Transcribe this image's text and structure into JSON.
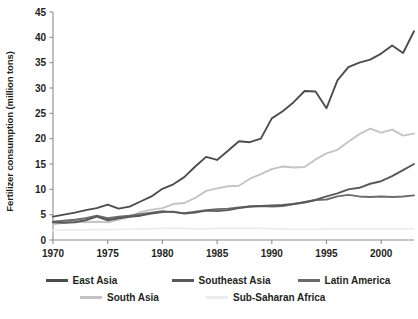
{
  "chart_data": {
    "type": "line",
    "title": "",
    "subtitle": "",
    "xlabel": "",
    "ylabel": "Fertilizer consumption (million tons)",
    "xlim": [
      1970,
      2003
    ],
    "ylim": [
      0,
      45
    ],
    "ytick_values": [
      0,
      5,
      10,
      15,
      20,
      25,
      30,
      35,
      40,
      45
    ],
    "ytick_labels": [
      "0",
      "5",
      "10",
      "15",
      "20",
      "25",
      "30",
      "35",
      "40",
      "45"
    ],
    "xtick_values": [
      1970,
      1975,
      1980,
      1985,
      1990,
      1995,
      2000
    ],
    "xtick_labels": [
      "1970",
      "1975",
      "1980",
      "1985",
      "1990",
      "1995",
      "2000"
    ],
    "grid": false,
    "legend_position": "bottom",
    "x": [
      1970,
      1971,
      1972,
      1973,
      1974,
      1975,
      1976,
      1977,
      1978,
      1979,
      1980,
      1981,
      1982,
      1983,
      1984,
      1985,
      1986,
      1987,
      1988,
      1989,
      1990,
      1991,
      1992,
      1993,
      1994,
      1995,
      1996,
      1997,
      1998,
      1999,
      2000,
      2001,
      2002,
      2003
    ],
    "series": [
      {
        "name": "East Asia",
        "color": "#4d4d4d",
        "values": [
          4.6,
          5.0,
          5.4,
          5.9,
          6.3,
          7.0,
          6.2,
          6.6,
          7.6,
          8.6,
          10.1,
          11.0,
          12.4,
          14.5,
          16.4,
          15.8,
          17.6,
          19.5,
          19.3,
          20.0,
          24.0,
          25.4,
          27.2,
          29.4,
          29.3,
          26.0,
          31.5,
          34.1,
          35.0,
          35.6,
          36.8,
          38.4,
          36.9,
          41.2
        ]
      },
      {
        "name": "Southeast Asia",
        "color": "#595959",
        "values": [
          3.5,
          3.4,
          3.5,
          3.9,
          4.6,
          3.9,
          4.3,
          4.6,
          4.8,
          5.2,
          5.5,
          5.6,
          5.2,
          5.4,
          5.8,
          5.7,
          5.9,
          6.3,
          6.6,
          6.7,
          6.8,
          6.9,
          7.1,
          7.4,
          7.9,
          8.6,
          9.2,
          10.0,
          10.3,
          11.1,
          11.6,
          12.6,
          13.8,
          15.0
        ]
      },
      {
        "name": "Latin America",
        "color": "#6b6b6b",
        "values": [
          3.6,
          3.8,
          4.0,
          4.3,
          4.8,
          4.3,
          4.6,
          4.8,
          5.1,
          5.4,
          5.7,
          5.5,
          5.3,
          5.6,
          5.9,
          6.1,
          6.2,
          6.4,
          6.6,
          6.7,
          6.6,
          6.7,
          7.1,
          7.5,
          7.9,
          8.0,
          8.6,
          8.9,
          8.6,
          8.5,
          8.6,
          8.5,
          8.6,
          8.8
        ]
      },
      {
        "name": "South Asia",
        "color": "#c4c4c4",
        "values": [
          3.1,
          3.4,
          3.7,
          3.5,
          3.6,
          3.5,
          4.0,
          4.6,
          5.5,
          6.0,
          6.3,
          7.1,
          7.3,
          8.3,
          9.7,
          10.2,
          10.6,
          10.7,
          12.1,
          13.0,
          14.0,
          14.5,
          14.3,
          14.4,
          15.9,
          17.1,
          17.8,
          19.4,
          20.9,
          22.0,
          21.2,
          21.8,
          20.6,
          21.0
        ]
      },
      {
        "name": "Sub-Saharan Africa",
        "color": "#ededed",
        "values": [
          1.9,
          2.0,
          2.0,
          2.0,
          2.1,
          2.0,
          2.1,
          2.1,
          2.2,
          2.2,
          2.3,
          2.3,
          2.3,
          2.2,
          2.2,
          2.3,
          2.3,
          2.3,
          2.3,
          2.3,
          2.2,
          2.2,
          2.1,
          2.1,
          2.1,
          2.2,
          2.2,
          2.2,
          2.2,
          2.2,
          2.2,
          2.2,
          2.2,
          2.2
        ]
      }
    ]
  },
  "legend": {
    "row1": [
      "East Asia",
      "Southeast Asia",
      "Latin America"
    ],
    "row2": [
      "South Asia",
      "Sub-Saharan Africa"
    ]
  }
}
